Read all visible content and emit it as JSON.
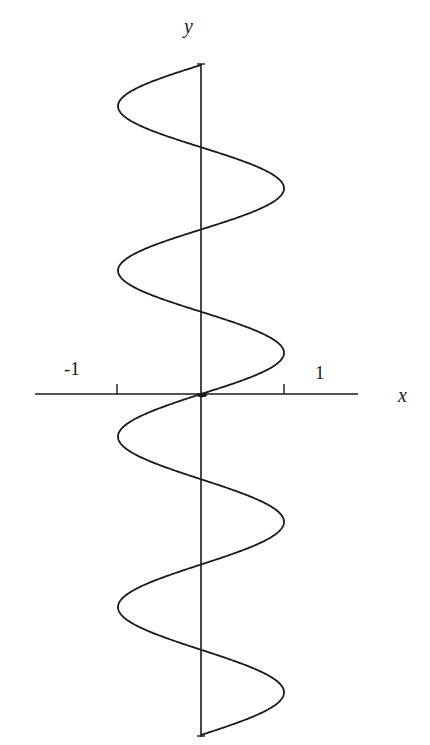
{
  "chart_data": {
    "type": "line",
    "title": "",
    "equation": "x = sin(y)",
    "xlabel": "x",
    "ylabel": "y",
    "xlim": [
      -1.9,
      1.9
    ],
    "ylim": [
      -12.566,
      12.566
    ],
    "x_ticks": [
      {
        "value": -1,
        "label": "-1"
      },
      {
        "value": 1,
        "label": "1"
      }
    ],
    "y_ticks": [],
    "grid": false,
    "legend": null,
    "series": [
      {
        "name": "x = sin(y)",
        "color": "#1a1a1a",
        "y_range": [
          -12.566,
          12.566
        ],
        "points_xy": [
          [
            0,
            -12.566
          ],
          [
            1,
            -10.996
          ],
          [
            0,
            -9.425
          ],
          [
            -1,
            -7.854
          ],
          [
            0,
            -6.283
          ],
          [
            1,
            -4.712
          ],
          [
            0,
            -3.142
          ],
          [
            -1,
            -1.571
          ],
          [
            0,
            0
          ],
          [
            1,
            1.571
          ],
          [
            0,
            3.142
          ],
          [
            -1,
            4.712
          ],
          [
            0,
            6.283
          ],
          [
            1,
            7.854
          ],
          [
            0,
            9.425
          ],
          [
            -1,
            10.996
          ],
          [
            0,
            12.566
          ]
        ]
      }
    ],
    "y_axis_crossings_px": [
      65,
      147,
      231,
      315,
      394,
      480,
      566,
      650,
      735
    ]
  },
  "labels": {
    "x_axis": "x",
    "y_axis": "y",
    "tick_neg_one": "-1",
    "tick_pos_one": "1"
  },
  "style": {
    "line_color": "#1a1a1a",
    "background": "#ffffff"
  }
}
